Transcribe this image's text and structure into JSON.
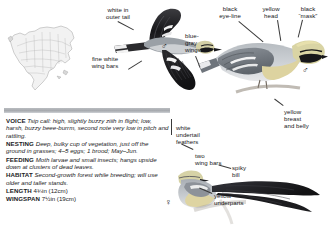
{
  "page": {
    "species_art_panel": "warbler field-guide plate"
  },
  "range_map": {
    "name": "north-america-range-map",
    "continent": "North America"
  },
  "callouts": {
    "white_outer_tail": "white in\nouter tail",
    "fine_white_wing_bars": "fine white\nwing bars",
    "blue_gray_wings": "blue-\ngray\nwings",
    "black_eye_line": "black\neye-line",
    "yellow_head": "yellow\nhead",
    "black_mask": "black\n“mask”",
    "yellow_breast_and_belly": "yellow\nbreast\nand belly",
    "white_undertail_feathers": "white\nundertail\nfeathers",
    "two_wing_bars": "two\nwing bars",
    "spiky_bill": "spiky\nbill",
    "yellow_underparts": "yellow\nunderparts"
  },
  "sex_symbols": {
    "flight_male": "♂",
    "perched_male": "♂",
    "perched_female": "♀"
  },
  "facts": [
    {
      "key": "VOICE",
      "text": "Tsip call: high, slightly buzzy ziiih in flight; low, harsh, buzzy beee-burrm, second note very low in pitch and rattling."
    },
    {
      "key": "NESTING",
      "text": "Deep, bulky cup of vegetation, just off the ground in grasses; 4–5 eggs; 1 brood; May–Jun."
    },
    {
      "key": "FEEDING",
      "text": "Moth larvae and small insects; hangs upside down at clusters of dead leaves."
    },
    {
      "key": "HABITAT",
      "text": "Second-growth forest while breeding; will use older and taller stands."
    },
    {
      "key": "LENGTH",
      "text": "4¾in (12cm)",
      "roman": true
    },
    {
      "key": "WINGSPAN",
      "text": "7½in (19cm)",
      "roman": true
    }
  ],
  "colors": {
    "text": "#17171a",
    "divider": "#a6a9ae",
    "leader": "#3a3a3a",
    "plumage_dark": "#2b2b2e",
    "plumage_gray": "#8d9298",
    "plumage_light": "#d9dadd",
    "yellow": "#d8c98a",
    "page_background": "#ffffff"
  }
}
